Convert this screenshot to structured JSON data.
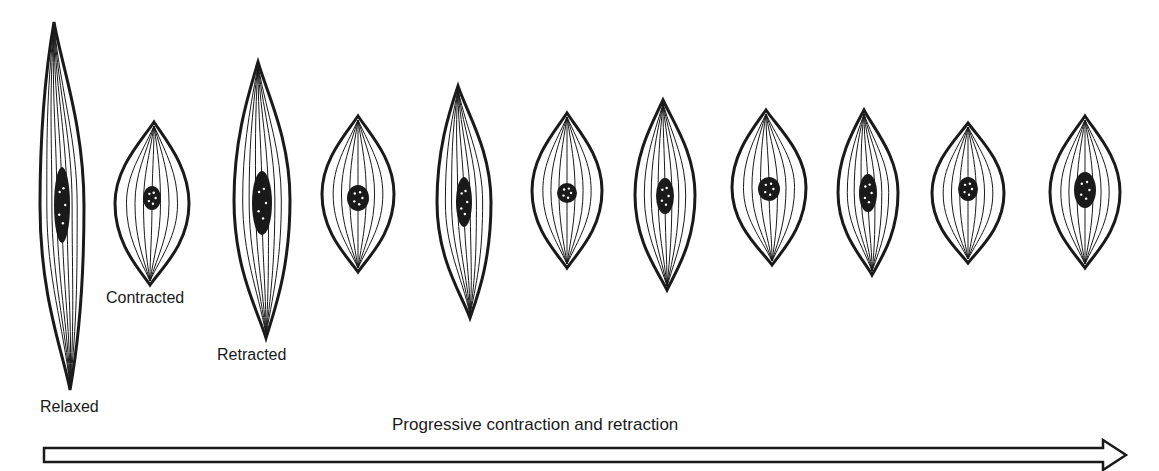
{
  "labels": {
    "relaxed": "Relaxed",
    "contracted": "Contracted",
    "retracted": "Retracted"
  },
  "arrow": {
    "label": "Progressive contraction and retraction",
    "direction": "right"
  },
  "cells": [
    {
      "id": 1,
      "state": "Relaxed",
      "cx": 62,
      "top": 22,
      "bottom": 390,
      "hw": 22,
      "lean": -8,
      "nucleus": {
        "cy": 205,
        "rx": 8,
        "ry": 38
      }
    },
    {
      "id": 2,
      "state": "Contracted",
      "cx": 152,
      "top": 122,
      "bottom": 285,
      "hw": 37,
      "lean": 2,
      "nucleus": {
        "cy": 198,
        "rx": 9,
        "ry": 12
      }
    },
    {
      "id": 3,
      "state": "Retracted",
      "cx": 262,
      "top": 62,
      "bottom": 338,
      "hw": 28,
      "lean": -4,
      "nucleus": {
        "cy": 203,
        "rx": 10,
        "ry": 32
      }
    },
    {
      "id": 4,
      "state": "",
      "cx": 358,
      "top": 116,
      "bottom": 272,
      "hw": 36,
      "lean": 0,
      "nucleus": {
        "cy": 198,
        "rx": 11,
        "ry": 13
      }
    },
    {
      "id": 5,
      "state": "",
      "cx": 464,
      "top": 86,
      "bottom": 318,
      "hw": 27,
      "lean": -6,
      "nucleus": {
        "cy": 202,
        "rx": 8,
        "ry": 25
      }
    },
    {
      "id": 6,
      "state": "",
      "cx": 567,
      "top": 113,
      "bottom": 268,
      "hw": 35,
      "lean": 0,
      "nucleus": {
        "cy": 193,
        "rx": 10,
        "ry": 10
      }
    },
    {
      "id": 7,
      "state": "",
      "cx": 665,
      "top": 100,
      "bottom": 290,
      "hw": 30,
      "lean": -2,
      "nucleus": {
        "cy": 196,
        "rx": 9,
        "ry": 18
      }
    },
    {
      "id": 8,
      "state": "",
      "cx": 769,
      "top": 110,
      "bottom": 265,
      "hw": 37,
      "lean": -3,
      "nucleus": {
        "cy": 189,
        "rx": 11,
        "ry": 12
      }
    },
    {
      "id": 9,
      "state": "",
      "cx": 868,
      "top": 110,
      "bottom": 275,
      "hw": 30,
      "lean": -4,
      "nucleus": {
        "cy": 193,
        "rx": 9,
        "ry": 19
      }
    },
    {
      "id": 10,
      "state": "",
      "cx": 968,
      "top": 123,
      "bottom": 263,
      "hw": 36,
      "lean": 0,
      "nucleus": {
        "cy": 189,
        "rx": 10,
        "ry": 12
      }
    },
    {
      "id": 11,
      "state": "",
      "cx": 1085,
      "top": 116,
      "bottom": 268,
      "hw": 35,
      "lean": 0,
      "nucleus": {
        "cy": 190,
        "rx": 11,
        "ry": 18
      }
    }
  ],
  "colors": {
    "ink": "#1a1a1a",
    "background": "#ffffff"
  }
}
